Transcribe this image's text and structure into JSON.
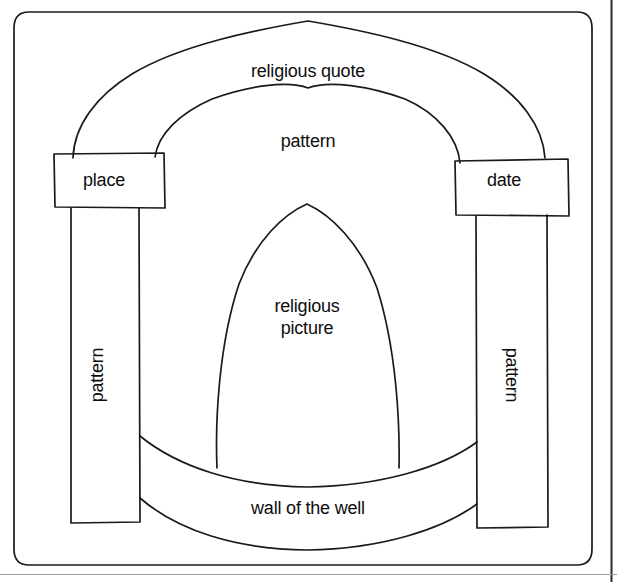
{
  "diagram": {
    "background_color": "#ffffff",
    "stroke_color": "#1a1a1a",
    "text_color": "#0d0d0d",
    "page_edge_line_color": "#2b2b2b",
    "footer_rule_color": "#9a9a9a",
    "labels": {
      "religious_quote": "religious quote",
      "pattern_top": "pattern",
      "place": "place",
      "date": "date",
      "religious_picture_line1": "religious",
      "religious_picture_line2": "picture",
      "pattern_left": "pattern",
      "pattern_right": "pattern",
      "wall_of_the_well": "wall of the well"
    },
    "parts": [
      {
        "name": "outer-frame",
        "label": ""
      },
      {
        "name": "outer-arch-band",
        "label": "religious quote"
      },
      {
        "name": "inner-arch-band",
        "label": "pattern"
      },
      {
        "name": "left-capital-box",
        "label": "place"
      },
      {
        "name": "right-capital-box",
        "label": "date"
      },
      {
        "name": "left-column",
        "label": "pattern"
      },
      {
        "name": "right-column",
        "label": "pattern"
      },
      {
        "name": "central-niche",
        "label": "religious picture"
      },
      {
        "name": "well-wall-band",
        "label": "wall of the well"
      }
    ]
  }
}
